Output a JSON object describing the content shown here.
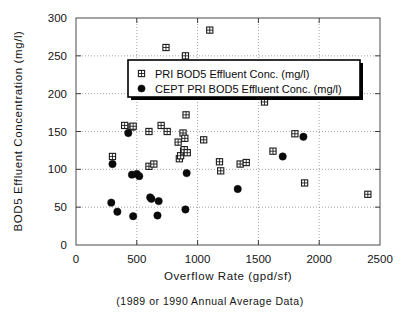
{
  "chart_data": {
    "type": "scatter",
    "title": "",
    "caption": "(1989 or 1990 Annual Average Data)",
    "xlabel": "Overflow Rate  (gpd/sf)",
    "ylabel": "BOD5 Effluent Concentration  (mg/l)",
    "xlim": [
      0,
      2500
    ],
    "ylim": [
      0,
      300
    ],
    "xticks": [
      0,
      500,
      1000,
      1500,
      2000,
      2500
    ],
    "yticks": [
      0,
      50,
      100,
      150,
      200,
      250,
      300
    ],
    "xtick_labels": [
      "0",
      "500",
      "1000",
      "1500",
      "2000",
      "2500"
    ],
    "ytick_labels": [
      "0",
      "50",
      "100",
      "150",
      "200",
      "250",
      "300"
    ],
    "grid": true,
    "grid_style": "dotted",
    "legend_position": "upper-center",
    "series": [
      {
        "name": "PRI BOD5 Effluent Conc. (mg/l)",
        "marker": "crosshatched-square",
        "color": "#1c1c1c",
        "points": [
          [
            300,
            117
          ],
          [
            400,
            158
          ],
          [
            460,
            156
          ],
          [
            470,
            157
          ],
          [
            600,
            150
          ],
          [
            600,
            104
          ],
          [
            640,
            107
          ],
          [
            700,
            158
          ],
          [
            740,
            261
          ],
          [
            750,
            150
          ],
          [
            840,
            136
          ],
          [
            850,
            114
          ],
          [
            860,
            118
          ],
          [
            880,
            148
          ],
          [
            885,
            124
          ],
          [
            890,
            126
          ],
          [
            895,
            141
          ],
          [
            900,
            250
          ],
          [
            905,
            172
          ],
          [
            915,
            122
          ],
          [
            1050,
            139
          ],
          [
            1100,
            284
          ],
          [
            1180,
            110
          ],
          [
            1190,
            98
          ],
          [
            1350,
            107
          ],
          [
            1400,
            109
          ],
          [
            1550,
            189
          ],
          [
            1620,
            124
          ],
          [
            1800,
            147
          ],
          [
            1880,
            82
          ],
          [
            2400,
            67
          ]
        ]
      },
      {
        "name": "CEPT PRI BOD5 Effluent Conc. (mg/l)",
        "marker": "filled-circle",
        "color": "#0a0a0a",
        "points": [
          [
            290,
            56
          ],
          [
            300,
            107
          ],
          [
            340,
            44
          ],
          [
            430,
            148
          ],
          [
            460,
            93
          ],
          [
            470,
            38
          ],
          [
            500,
            94
          ],
          [
            520,
            91
          ],
          [
            610,
            63
          ],
          [
            620,
            61
          ],
          [
            670,
            39
          ],
          [
            680,
            58
          ],
          [
            900,
            47
          ],
          [
            910,
            95
          ],
          [
            1330,
            74
          ],
          [
            1700,
            117
          ],
          [
            1870,
            143
          ]
        ]
      }
    ]
  }
}
